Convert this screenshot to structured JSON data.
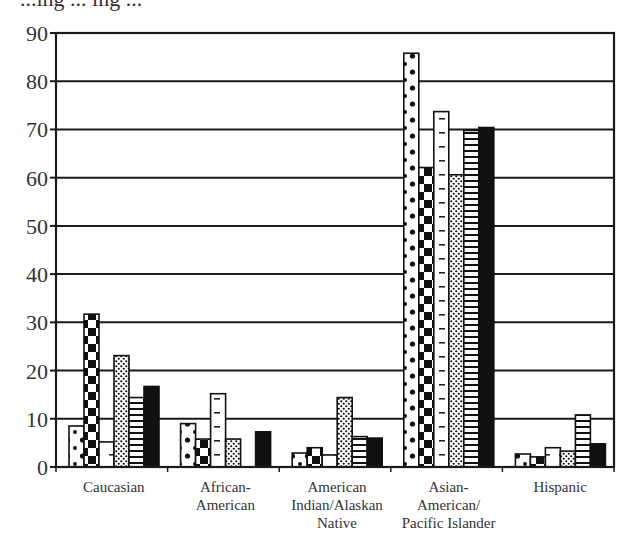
{
  "header": {
    "partial_title_text": "...ing ... ing ..."
  },
  "chart_data": {
    "type": "bar",
    "title": "",
    "xlabel": "",
    "ylabel": "",
    "ylim": [
      0,
      90
    ],
    "yticks": [
      0,
      10,
      20,
      30,
      40,
      50,
      60,
      70,
      80,
      90
    ],
    "grid": true,
    "legend": "none visible",
    "categories": [
      "Caucasian",
      "African-American",
      "American Indian/Alaskan Native",
      "Asian-American/Pacific Islander",
      "Hispanic"
    ],
    "category_label_lines": [
      [
        "Caucasian"
      ],
      [
        "African-",
        "American"
      ],
      [
        "American",
        "Indian/Alaskan",
        "Native"
      ],
      [
        "Asian-",
        "American/",
        "Pacific Islander"
      ],
      [
        "Hispanic"
      ]
    ],
    "series": [
      {
        "name": "Series 1 (large dots)",
        "pattern": "dots",
        "values": [
          8.5,
          9.0,
          2.9,
          85.8,
          2.7
        ]
      },
      {
        "name": "Series 2 (checker blocks)",
        "pattern": "checker",
        "values": [
          31.7,
          5.8,
          4.0,
          62.1,
          2.1
        ]
      },
      {
        "name": "Series 3 (dashes)",
        "pattern": "dashes",
        "values": [
          5.2,
          15.2,
          2.5,
          73.7,
          4.0
        ]
      },
      {
        "name": "Series 4 (fine crosshatch)",
        "pattern": "crosshatch",
        "values": [
          23.1,
          5.8,
          14.4,
          60.6,
          3.3
        ]
      },
      {
        "name": "Series 5 (horizontal stripes)",
        "pattern": "hstripes",
        "values": [
          14.4,
          0,
          6.3,
          69.8,
          10.8
        ]
      },
      {
        "name": "Series 6 (solid black)",
        "pattern": "solid",
        "values": [
          16.7,
          7.3,
          6.0,
          70.4,
          4.8
        ]
      }
    ]
  },
  "colors": {
    "bar_stroke": "#111111",
    "grid": "#1a1a1a",
    "text": "#333333",
    "background": "#ffffff"
  }
}
